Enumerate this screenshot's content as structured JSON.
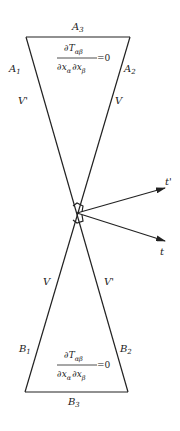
{
  "diagram": {
    "colors": {
      "ink": "#222222",
      "background": "#ffffff"
    },
    "top_region": {
      "edge_top": {
        "letter": "A",
        "index": "3"
      },
      "edge_left": {
        "letter": "A",
        "index": "1"
      },
      "edge_right": {
        "letter": "A",
        "index": "2"
      },
      "side_left_label": "V'",
      "side_right_label": "V",
      "equation": {
        "numerator": "∂T",
        "numerator_sub": "αβ",
        "denominator_1": "∂x",
        "denominator_1_sub": "α",
        "denominator_2": "∂x",
        "denominator_2_sub": "β",
        "rhs": "=0"
      }
    },
    "bottom_region": {
      "edge_bottom": {
        "letter": "B",
        "index": "3"
      },
      "edge_left": {
        "letter": "B",
        "index": "1"
      },
      "edge_right": {
        "letter": "B",
        "index": "2"
      },
      "side_left_label": "V",
      "side_right_label": "V'",
      "equation": {
        "numerator": "∂T",
        "numerator_sub": "αβ",
        "denominator_1": "∂x",
        "denominator_1_sub": "α",
        "denominator_2": "∂x",
        "denominator_2_sub": "β",
        "rhs": "=0"
      }
    },
    "vectors": [
      {
        "name": "t-prime",
        "label": "t'"
      },
      {
        "name": "t",
        "label": "t"
      }
    ]
  }
}
